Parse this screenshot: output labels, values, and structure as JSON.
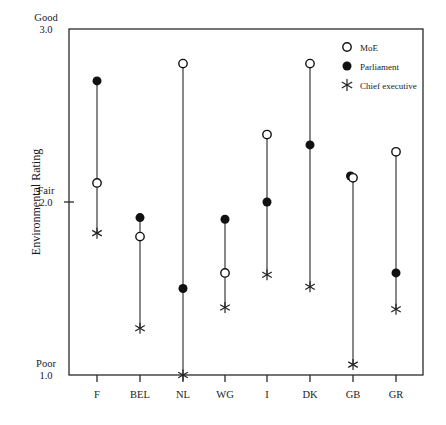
{
  "chart_data": {
    "type": "scatter",
    "title": "",
    "xlabel": "",
    "ylabel": "Environmental Rating",
    "ylim": [
      1.0,
      3.0
    ],
    "yticks": [
      {
        "value": 3.0,
        "label_top": "Good",
        "label_bottom": "3.0"
      },
      {
        "value": 2.0,
        "label_top": "Fair",
        "label_bottom": "2.0"
      },
      {
        "value": 1.0,
        "label_top": "Poor",
        "label_bottom": "1.0"
      }
    ],
    "categories": [
      "F",
      "BEL",
      "NL",
      "WG",
      "I",
      "DK",
      "GB",
      "GR"
    ],
    "series": [
      {
        "name": "MoE",
        "marker": "open-circle",
        "values": [
          2.11,
          1.8,
          2.8,
          1.59,
          2.39,
          2.8,
          2.14,
          2.29
        ]
      },
      {
        "name": "Parliament",
        "marker": "filled-circle",
        "values": [
          2.7,
          1.91,
          1.5,
          1.9,
          2.0,
          2.33,
          2.15,
          1.59
        ]
      },
      {
        "name": "Chief executive",
        "marker": "asterisk",
        "values": [
          1.82,
          1.27,
          1.0,
          1.39,
          1.58,
          1.51,
          1.06,
          1.38
        ]
      }
    ],
    "vertical_range_lines": true,
    "grid": false,
    "legend_position": "top-right-inside"
  },
  "legend": {
    "items": [
      {
        "label": "MoE",
        "icon": "open-circle-icon"
      },
      {
        "label": "Parliament",
        "icon": "filled-circle-icon"
      },
      {
        "label": "Chief executive",
        "icon": "asterisk-icon"
      }
    ]
  }
}
